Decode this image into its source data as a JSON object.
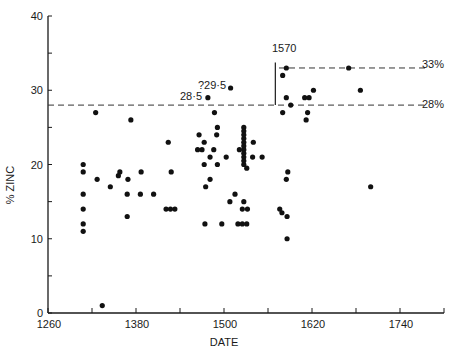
{
  "chart_data": {
    "type": "scatter",
    "title": "",
    "xlabel": "DATE",
    "ylabel": "% ZINC",
    "xlim": [
      1260,
      1800
    ],
    "ylim": [
      0,
      40
    ],
    "x_ticks": [
      1260,
      1320,
      1380,
      1440,
      1500,
      1560,
      1620,
      1680,
      1740,
      1800
    ],
    "x_tick_labels": [
      "1260",
      "1380",
      "1500",
      "1620",
      "1740"
    ],
    "x_tick_label_values": [
      1260,
      1380,
      1500,
      1620,
      1740
    ],
    "y_ticks": [
      0,
      5,
      10,
      15,
      20,
      25,
      30,
      35,
      40
    ],
    "y_tick_labels": [
      "0",
      "10",
      "20",
      "30",
      "40"
    ],
    "y_tick_label_values": [
      0,
      10,
      20,
      30,
      40
    ],
    "grid": false,
    "legend": null,
    "reference_lines": [
      {
        "value": 28,
        "label": "28%",
        "x_start": 1260,
        "x_end": 1775,
        "style": "dashed"
      },
      {
        "value": 33,
        "label": "33%",
        "x_start": 1575,
        "x_end": 1775,
        "style": "dashed"
      }
    ],
    "vertical_marker": {
      "x": 1570,
      "label": "1570",
      "y_start": 28,
      "y_end": 34
    },
    "annotations": [
      {
        "text": "?29·5",
        "x": 1509,
        "y": 30.3,
        "anchor": "point-label"
      },
      {
        "text": "28·5",
        "x": 1478,
        "y": 29.1,
        "anchor": "point-label"
      }
    ],
    "points": [
      {
        "x": 1308,
        "y": 20
      },
      {
        "x": 1308,
        "y": 19
      },
      {
        "x": 1308,
        "y": 16
      },
      {
        "x": 1308,
        "y": 14
      },
      {
        "x": 1308,
        "y": 12
      },
      {
        "x": 1308,
        "y": 11
      },
      {
        "x": 1325,
        "y": 27
      },
      {
        "x": 1327,
        "y": 18
      },
      {
        "x": 1334,
        "y": 1
      },
      {
        "x": 1345,
        "y": 17
      },
      {
        "x": 1356,
        "y": 18.5
      },
      {
        "x": 1358,
        "y": 19
      },
      {
        "x": 1368,
        "y": 16
      },
      {
        "x": 1369,
        "y": 18
      },
      {
        "x": 1368,
        "y": 13
      },
      {
        "x": 1373,
        "y": 26
      },
      {
        "x": 1386,
        "y": 16
      },
      {
        "x": 1387,
        "y": 19
      },
      {
        "x": 1404,
        "y": 16
      },
      {
        "x": 1421,
        "y": 14
      },
      {
        "x": 1427,
        "y": 14
      },
      {
        "x": 1433,
        "y": 14
      },
      {
        "x": 1424,
        "y": 23
      },
      {
        "x": 1428,
        "y": 19
      },
      {
        "x": 1464,
        "y": 22
      },
      {
        "x": 1466,
        "y": 24
      },
      {
        "x": 1470,
        "y": 22
      },
      {
        "x": 1473,
        "y": 23
      },
      {
        "x": 1473,
        "y": 20
      },
      {
        "x": 1475,
        "y": 17
      },
      {
        "x": 1474,
        "y": 12
      },
      {
        "x": 1478,
        "y": 29
      },
      {
        "x": 1481,
        "y": 21
      },
      {
        "x": 1481,
        "y": 18
      },
      {
        "x": 1486,
        "y": 22
      },
      {
        "x": 1487,
        "y": 27
      },
      {
        "x": 1490,
        "y": 24
      },
      {
        "x": 1491,
        "y": 25
      },
      {
        "x": 1491,
        "y": 20
      },
      {
        "x": 1497,
        "y": 12
      },
      {
        "x": 1503,
        "y": 21
      },
      {
        "x": 1508,
        "y": 15
      },
      {
        "x": 1509,
        "y": 30.3
      },
      {
        "x": 1515,
        "y": 16
      },
      {
        "x": 1519,
        "y": 12
      },
      {
        "x": 1521,
        "y": 22
      },
      {
        "x": 1525,
        "y": 12
      },
      {
        "x": 1525,
        "y": 14
      },
      {
        "x": 1527,
        "y": 25
      },
      {
        "x": 1527,
        "y": 24.5
      },
      {
        "x": 1527,
        "y": 24
      },
      {
        "x": 1527,
        "y": 23.5
      },
      {
        "x": 1527,
        "y": 23
      },
      {
        "x": 1527,
        "y": 22.5
      },
      {
        "x": 1527,
        "y": 22
      },
      {
        "x": 1527,
        "y": 21.5
      },
      {
        "x": 1527,
        "y": 21
      },
      {
        "x": 1527,
        "y": 20.5
      },
      {
        "x": 1527,
        "y": 20
      },
      {
        "x": 1527,
        "y": 15
      },
      {
        "x": 1531,
        "y": 19.5
      },
      {
        "x": 1532,
        "y": 14
      },
      {
        "x": 1531,
        "y": 12
      },
      {
        "x": 1540,
        "y": 23
      },
      {
        "x": 1539,
        "y": 21
      },
      {
        "x": 1552,
        "y": 21
      },
      {
        "x": 1576,
        "y": 14
      },
      {
        "x": 1579,
        "y": 13.5
      },
      {
        "x": 1580,
        "y": 27
      },
      {
        "x": 1580,
        "y": 32
      },
      {
        "x": 1585,
        "y": 33
      },
      {
        "x": 1585,
        "y": 29
      },
      {
        "x": 1585,
        "y": 18
      },
      {
        "x": 1586,
        "y": 13
      },
      {
        "x": 1586,
        "y": 10
      },
      {
        "x": 1587,
        "y": 19
      },
      {
        "x": 1591,
        "y": 28
      },
      {
        "x": 1610,
        "y": 29
      },
      {
        "x": 1612,
        "y": 26
      },
      {
        "x": 1614,
        "y": 27
      },
      {
        "x": 1616,
        "y": 29
      },
      {
        "x": 1622,
        "y": 30
      },
      {
        "x": 1670,
        "y": 33
      },
      {
        "x": 1686,
        "y": 30
      },
      {
        "x": 1700,
        "y": 17
      }
    ]
  },
  "labels": {
    "xlabel": "DATE",
    "ylabel": "% ZINC",
    "marker_1570": "1570",
    "line_33": "33%",
    "line_28": "28%",
    "ann_295": "?29·5",
    "ann_285": "28·5"
  }
}
